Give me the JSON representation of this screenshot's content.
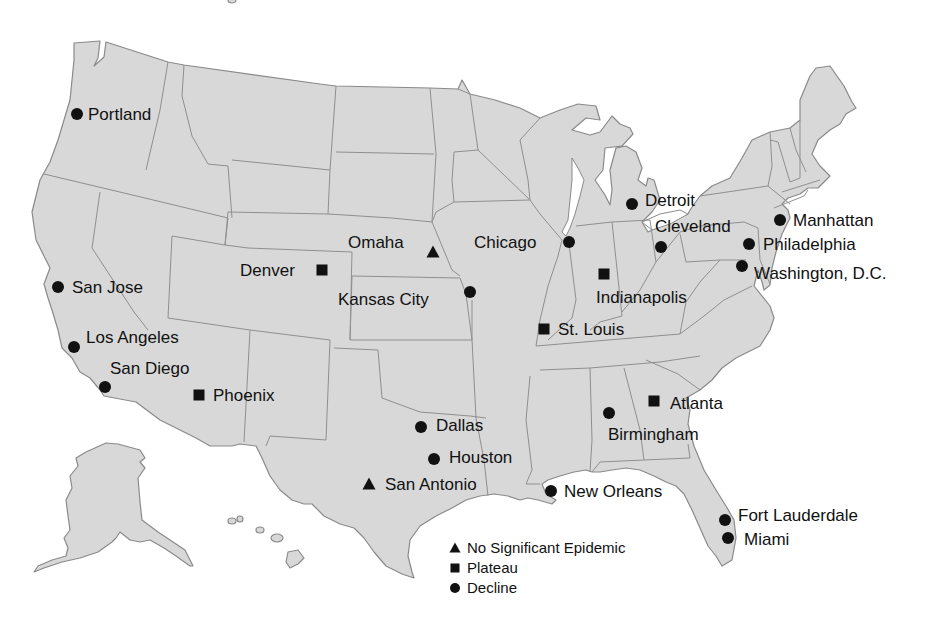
{
  "map": {
    "fill": "#d8d8d8",
    "border": "#8a8a8a",
    "marker_color": "#111111"
  },
  "legend": {
    "items": [
      {
        "shape": "triangle",
        "label": "No Significant Epidemic",
        "x": 455,
        "y": 548
      },
      {
        "shape": "square",
        "label": "Plateau",
        "x": 455,
        "y": 568
      },
      {
        "shape": "circle",
        "label": "Decline",
        "x": 455,
        "y": 588
      }
    ]
  },
  "cities": [
    {
      "name": "Portland",
      "shape": "circle",
      "x": 77,
      "y": 114,
      "lx": 88,
      "ly": 120
    },
    {
      "name": "San Jose",
      "shape": "circle",
      "x": 58,
      "y": 287,
      "lx": 72,
      "ly": 293
    },
    {
      "name": "Los Angeles",
      "shape": "circle",
      "x": 74,
      "y": 347,
      "lx": 86,
      "ly": 343
    },
    {
      "name": "San Diego",
      "shape": "circle",
      "x": 105,
      "y": 387,
      "lx": 110,
      "ly": 374
    },
    {
      "name": "Phoenix",
      "shape": "square",
      "x": 199,
      "y": 395,
      "lx": 213,
      "ly": 401
    },
    {
      "name": "Denver",
      "shape": "square",
      "x": 322,
      "y": 270,
      "lx": 240,
      "ly": 276
    },
    {
      "name": "Omaha",
      "shape": "triangle",
      "x": 433,
      "y": 252,
      "lx": 348,
      "ly": 248
    },
    {
      "name": "Kansas City",
      "shape": "circle",
      "x": 470,
      "y": 292,
      "lx": 338,
      "ly": 305
    },
    {
      "name": "Dallas",
      "shape": "circle",
      "x": 421,
      "y": 427,
      "lx": 436,
      "ly": 431
    },
    {
      "name": "Houston",
      "shape": "circle",
      "x": 434,
      "y": 459,
      "lx": 449,
      "ly": 463
    },
    {
      "name": "San Antonio",
      "shape": "triangle",
      "x": 369,
      "y": 484,
      "lx": 385,
      "ly": 490
    },
    {
      "name": "Chicago",
      "shape": "circle",
      "x": 569,
      "y": 242,
      "lx": 474,
      "ly": 248
    },
    {
      "name": "St. Louis",
      "shape": "square",
      "x": 544,
      "y": 329,
      "lx": 558,
      "ly": 335
    },
    {
      "name": "Indianapolis",
      "shape": "square",
      "x": 604,
      "y": 274,
      "lx": 596,
      "ly": 303
    },
    {
      "name": "Detroit",
      "shape": "circle",
      "x": 632,
      "y": 204,
      "lx": 645,
      "ly": 206
    },
    {
      "name": "Cleveland",
      "shape": "circle",
      "x": 661,
      "y": 247,
      "lx": 655,
      "ly": 232
    },
    {
      "name": "Manhattan",
      "shape": "circle",
      "x": 780,
      "y": 220,
      "lx": 793,
      "ly": 226
    },
    {
      "name": "Philadelphia",
      "shape": "circle",
      "x": 749,
      "y": 244,
      "lx": 763,
      "ly": 250
    },
    {
      "name": "Washington, D.C.",
      "shape": "circle",
      "x": 742,
      "y": 266,
      "lx": 754,
      "ly": 279
    },
    {
      "name": "Atlanta",
      "shape": "square",
      "x": 654,
      "y": 401,
      "lx": 670,
      "ly": 409
    },
    {
      "name": "Birmingham",
      "shape": "circle",
      "x": 609,
      "y": 413,
      "lx": 608,
      "ly": 440
    },
    {
      "name": "New Orleans",
      "shape": "circle",
      "x": 551,
      "y": 491,
      "lx": 564,
      "ly": 497
    },
    {
      "name": "Fort Lauderdale",
      "shape": "circle",
      "x": 725,
      "y": 520,
      "lx": 738,
      "ly": 521
    },
    {
      "name": "Miami",
      "shape": "circle",
      "x": 728,
      "y": 538,
      "lx": 744,
      "ly": 545
    }
  ]
}
